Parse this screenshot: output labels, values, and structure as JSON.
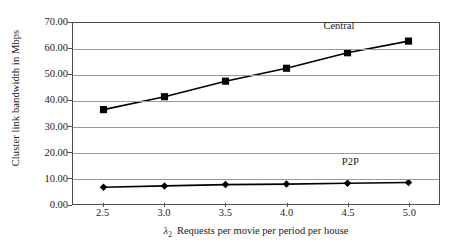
{
  "chart_data": {
    "type": "line",
    "title": "",
    "xlabel_symbol": "λ",
    "xlabel_subscript": "2",
    "xlabel_text": "Requests per movie per period per house",
    "xlabel": "λ2 Requests per movie per period per house",
    "ylabel": "Cluster link bandwidth in Mbps",
    "x": [
      2.5,
      3.0,
      3.5,
      4.0,
      4.5,
      5.0
    ],
    "xticklabels": [
      "2.5",
      "3.0",
      "3.5",
      "4.0",
      "4.5",
      "5.0"
    ],
    "yticks": [
      0,
      10,
      20,
      30,
      40,
      50,
      60,
      70
    ],
    "yticklabels": [
      "0.00",
      "10.00",
      "20.00",
      "30.00",
      "40.00",
      "50.00",
      "60.00",
      "70.00"
    ],
    "xlim": [
      2.25,
      5.25
    ],
    "ylim": [
      0,
      70
    ],
    "grid": "horizontal",
    "legend_position": "inline-annotation",
    "series": [
      {
        "name": "Central",
        "marker": "square",
        "color": "#000000",
        "values": [
          36.5,
          41.5,
          47.5,
          52.5,
          58.5,
          63.0
        ],
        "annotation": "Central"
      },
      {
        "name": "P2P",
        "marker": "diamond",
        "color": "#000000",
        "values": [
          6.5,
          7.0,
          7.5,
          7.7,
          8.0,
          8.3
        ],
        "annotation": "P2P"
      }
    ],
    "annotations": [
      {
        "text": "Central",
        "x": 4.3,
        "y": 68.5
      },
      {
        "text": "P2P",
        "x": 4.45,
        "y": 16.5
      }
    ]
  },
  "colors": {
    "background": "#ffffff",
    "axis": "#4d4d4d",
    "gridline": "#9a9a9a",
    "ink": "#1a1a1a",
    "series": "#000000"
  }
}
